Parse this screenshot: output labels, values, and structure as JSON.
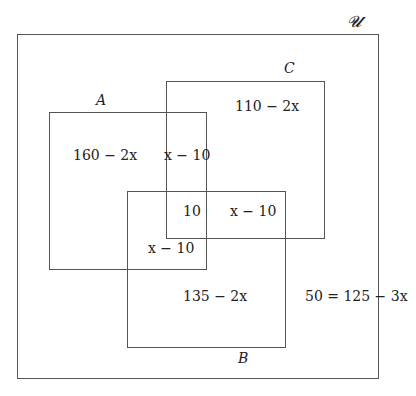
{
  "diagram": {
    "type": "venn-rectangles",
    "universe": {
      "label": "𝓤"
    },
    "sets": {
      "A": {
        "label": "A"
      },
      "B": {
        "label": "B"
      },
      "C": {
        "label": "C"
      }
    },
    "regions": {
      "A_only": "160 − 2x",
      "C_only": "110 − 2x",
      "B_only": "135 − 2x",
      "A_and_C_only": "x − 10",
      "A_and_B_and_C": "10",
      "B_and_C_only": "x − 10",
      "A_and_B_only": "x − 10",
      "outside": "50 = 125 − 3x"
    }
  }
}
